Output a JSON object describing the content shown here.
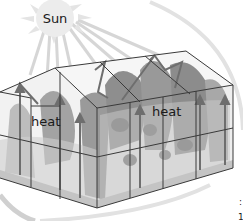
{
  "diagram": {
    "sun": {
      "label": "Sun",
      "color": "#e6e6e6",
      "ray_color": "#d4d4d4"
    },
    "labels": [
      {
        "id": "heat-left",
        "text": "heat"
      },
      {
        "id": "heat-right",
        "text": "heat"
      }
    ],
    "edge_fragments": [
      ":",
      "1"
    ],
    "colors": {
      "frame": "#3a3a3a",
      "glass": "#f0f0f0",
      "plants_dark": "#8c8c8c",
      "plants_light": "#b8b8b8",
      "floor": "#c8c8c8",
      "arrow": "#6e6e6e",
      "arc": "#e2e2e2"
    }
  }
}
